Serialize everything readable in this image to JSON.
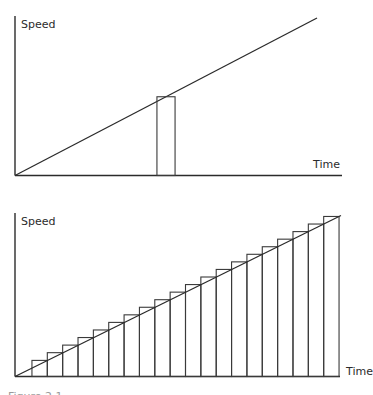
{
  "chart_data": [
    {
      "type": "line",
      "title": "",
      "xlabel": "Time",
      "ylabel": "Speed",
      "description": "Speed increasing linearly with time; a single thin rectangle (time slice) under the line",
      "line": {
        "x": [
          0,
          1
        ],
        "y": [
          0,
          1
        ]
      },
      "xlim": [
        0,
        1.08
      ],
      "ylim": [
        0,
        1
      ],
      "slices": [
        {
          "x_start": 0.47,
          "x_end": 0.53,
          "height": 0.5
        }
      ],
      "grid": false
    },
    {
      "type": "bar",
      "title": "",
      "xlabel": "Time",
      "ylabel": "Speed",
      "description": "Speed increasing linearly with time approximated by 20 rectangles (upper step sum)",
      "line": {
        "x": [
          0,
          1
        ],
        "y": [
          0,
          1
        ]
      },
      "xlim": [
        0,
        1.0
      ],
      "ylim": [
        0,
        1
      ],
      "bar_start": 0.052,
      "bar_end": 0.994,
      "bar_count": 20,
      "bar_heights": [
        0.1,
        0.148,
        0.195,
        0.242,
        0.289,
        0.336,
        0.383,
        0.43,
        0.477,
        0.524,
        0.571,
        0.618,
        0.665,
        0.712,
        0.759,
        0.806,
        0.853,
        0.9,
        0.947,
        0.994
      ],
      "grid": false
    }
  ],
  "labels": {
    "top_ylabel": "Speed",
    "top_xlabel": "Time",
    "bottom_ylabel": "Speed",
    "bottom_xlabel": "Time",
    "caption": "Figure 2.1"
  }
}
